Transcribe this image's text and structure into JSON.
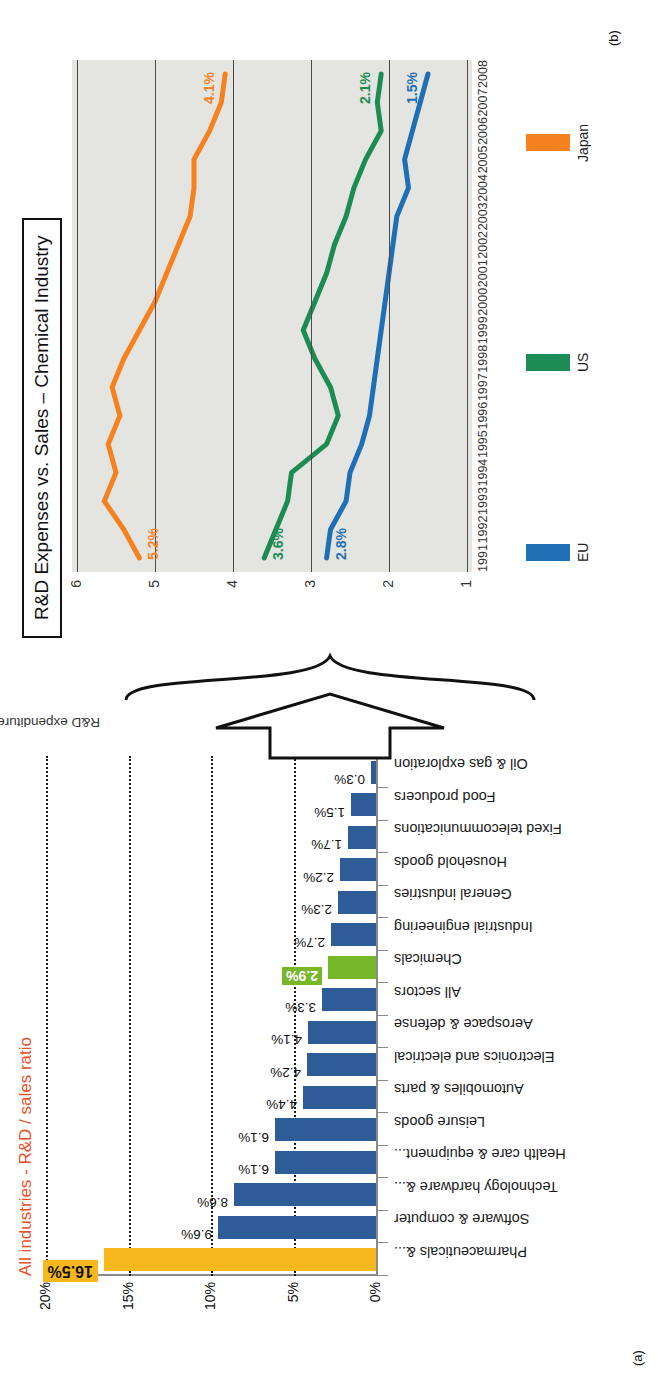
{
  "panel_a": {
    "tag": "(a)",
    "title": "All industries - R&D / sales ratio",
    "title_color": "#E8502A",
    "y_ticks": [
      "0%",
      "5%",
      "10%",
      "15%",
      "20%"
    ]
  },
  "panel_b": {
    "tag": "(b)",
    "title": "R&D Expenses vs. Sales – Chemical Industry",
    "y_axis_label": "R&D expenditure (% of sales)",
    "y_ticks": [
      "1",
      "2",
      "3",
      "4",
      "5",
      "6"
    ],
    "legend": [
      {
        "label": "EU",
        "color": "#1F6FB5"
      },
      {
        "label": "US",
        "color": "#1C8C54"
      },
      {
        "label": "Japan",
        "color": "#F5821F"
      }
    ],
    "end_labels": {
      "eu_start": "2.8%",
      "eu_end": "1.5%",
      "us_start": "3.6%",
      "us_end": "2.1%",
      "jp_start": "5.2%",
      "jp_end": "4.1%"
    }
  },
  "chart_data": [
    {
      "type": "bar",
      "title": "All industries - R&D / sales ratio",
      "xlabel": "",
      "ylabel": "R&D / sales ratio",
      "ylim": [
        0,
        20
      ],
      "ytick_labels": [
        "0%",
        "5%",
        "10%",
        "15%",
        "20%"
      ],
      "grid": true,
      "categories": [
        "Pharmaceuticals &...",
        "Software & computer",
        "Technology hardware &...",
        "Health care & equipment...",
        "Leisure goods",
        "Automobiles & parts",
        "Electronics and electrical",
        "Aerospace & defense",
        "All sectors",
        "Chemicals",
        "Industrial engineering",
        "General industries",
        "Household goods",
        "Fixed telecommunications",
        "Food producers",
        "Oil & gas exploration"
      ],
      "values": [
        16.5,
        9.6,
        8.6,
        6.1,
        6.1,
        4.4,
        4.2,
        4.1,
        3.3,
        2.9,
        2.7,
        2.3,
        2.2,
        1.7,
        1.5,
        0.3
      ],
      "value_labels": [
        "16.5%",
        "9.6%",
        "8.6%",
        "6.1%",
        "6.1%",
        "4.4%",
        "4.2%",
        "4.1%",
        "3.3%",
        "2.9%",
        "2.7%",
        "2.3%",
        "2.2%",
        "1.7%",
        "1.5%",
        "0.3%"
      ],
      "bar_colors": [
        "#F6B81C",
        "#2D5C96",
        "#2D5C96",
        "#2D5C96",
        "#2D5C96",
        "#2D5C96",
        "#2D5C96",
        "#2D5C96",
        "#2D5C96",
        "#76B82A",
        "#2D5C96",
        "#2D5C96",
        "#2D5C96",
        "#2D5C96",
        "#2D5C96",
        "#2D5C96"
      ],
      "highlight": {
        "Pharmaceuticals &...": "#F6B81C",
        "Chemicals": "#76B82A"
      }
    },
    {
      "type": "line",
      "title": "R&D Expenses vs. Sales – Chemical Industry",
      "xlabel": "",
      "ylabel": "R&D expenditure (% of sales)",
      "ylim": [
        1,
        6
      ],
      "grid": true,
      "legend_position": "bottom",
      "x": [
        1991,
        1992,
        1993,
        1994,
        1995,
        1996,
        1997,
        1998,
        1999,
        2000,
        2001,
        2002,
        2003,
        2004,
        2005,
        2006,
        2007,
        2008
      ],
      "series": [
        {
          "name": "EU",
          "color": "#1F6FB5",
          "values": [
            2.8,
            2.75,
            2.55,
            2.5,
            2.35,
            2.25,
            2.2,
            2.15,
            2.1,
            2.05,
            2.0,
            1.95,
            1.9,
            1.75,
            1.8,
            1.7,
            1.6,
            1.5
          ]
        },
        {
          "name": "US",
          "color": "#1C8C54",
          "values": [
            3.6,
            3.45,
            3.3,
            3.25,
            2.8,
            2.65,
            2.75,
            2.95,
            3.1,
            2.95,
            2.8,
            2.7,
            2.55,
            2.45,
            2.3,
            2.1,
            2.15,
            2.1
          ]
        },
        {
          "name": "Japan",
          "color": "#F5821F",
          "values": [
            5.2,
            5.4,
            5.65,
            5.5,
            5.6,
            5.45,
            5.55,
            5.4,
            5.2,
            5.0,
            4.85,
            4.7,
            4.55,
            4.5,
            4.5,
            4.3,
            4.15,
            4.1
          ]
        }
      ],
      "annotations": [
        "5.2%",
        "4.1%",
        "3.6%",
        "2.1%",
        "2.8%",
        "1.5%"
      ]
    }
  ]
}
